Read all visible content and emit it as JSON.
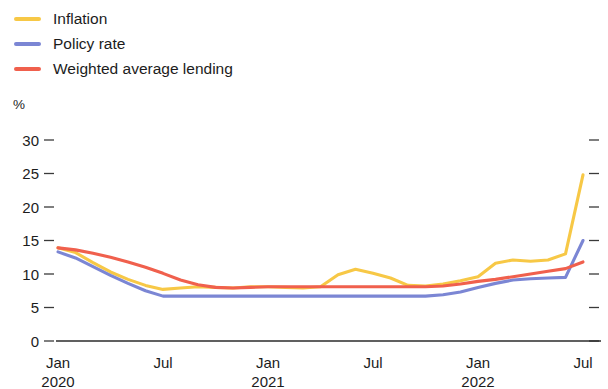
{
  "legend": {
    "items": [
      {
        "label": "Inflation",
        "color": "#F7C846",
        "key": "inflation"
      },
      {
        "label": "Policy rate",
        "color": "#7B86D4",
        "key": "policy_rate"
      },
      {
        "label": "Weighted average lending",
        "color": "#F0604D",
        "key": "weighted_average_lending"
      }
    ]
  },
  "axis": {
    "unit_label": "%"
  },
  "chart_data": {
    "type": "line",
    "title": "",
    "subtitle": "",
    "xlabel": "",
    "ylabel": "%",
    "ylim": [
      0,
      30
    ],
    "yticks": [
      0,
      5,
      10,
      15,
      20,
      25,
      30
    ],
    "ytick_labels": [
      "0",
      "5",
      "10",
      "15",
      "20",
      "25",
      "30"
    ],
    "grid": false,
    "legend_position": "top-left",
    "x_tick_labels": [
      "Jan",
      "Jul",
      "Jan",
      "Jul",
      "Jan",
      "Jul"
    ],
    "x_tick_years": [
      "2020",
      "",
      "2021",
      "",
      "2022",
      ""
    ],
    "x_tick_x": [
      "2020-01",
      "2020-07",
      "2021-01",
      "2021-07",
      "2022-01",
      "2022-07"
    ],
    "x": [
      "2020-01",
      "2020-02",
      "2020-03",
      "2020-04",
      "2020-05",
      "2020-06",
      "2020-07",
      "2020-08",
      "2020-09",
      "2020-10",
      "2020-11",
      "2020-12",
      "2021-01",
      "2021-02",
      "2021-03",
      "2021-04",
      "2021-05",
      "2021-06",
      "2021-07",
      "2021-08",
      "2021-09",
      "2021-10",
      "2021-11",
      "2021-12",
      "2022-01",
      "2022-02",
      "2022-03",
      "2022-04",
      "2022-05",
      "2022-06",
      "2022-07"
    ],
    "series": [
      {
        "name": "Inflation",
        "color": "#F7C846",
        "values": [
          13.9,
          13.2,
          11.7,
          10.3,
          9.2,
          8.3,
          7.7,
          7.9,
          8.1,
          8.0,
          7.9,
          8.1,
          8.1,
          8.0,
          7.9,
          8.1,
          9.9,
          10.7,
          10.1,
          9.4,
          8.3,
          8.2,
          8.5,
          9.0,
          9.6,
          11.6,
          12.1,
          11.9,
          12.1,
          13.0,
          24.8
        ]
      },
      {
        "name": "Policy rate",
        "color": "#7B86D4",
        "values": [
          13.3,
          12.4,
          11.1,
          9.8,
          8.6,
          7.5,
          6.7,
          6.7,
          6.7,
          6.7,
          6.7,
          6.7,
          6.7,
          6.7,
          6.7,
          6.7,
          6.7,
          6.7,
          6.7,
          6.7,
          6.7,
          6.7,
          6.9,
          7.3,
          8.0,
          8.6,
          9.1,
          9.3,
          9.4,
          9.5,
          15.0
        ]
      },
      {
        "name": "Weighted average lending",
        "color": "#F0604D",
        "values": [
          13.9,
          13.6,
          13.1,
          12.5,
          11.8,
          11.0,
          10.1,
          9.1,
          8.4,
          8.0,
          7.9,
          8.0,
          8.1,
          8.1,
          8.1,
          8.1,
          8.1,
          8.1,
          8.1,
          8.1,
          8.1,
          8.1,
          8.2,
          8.5,
          8.9,
          9.2,
          9.6,
          10.0,
          10.4,
          10.8,
          11.8
        ]
      }
    ]
  }
}
